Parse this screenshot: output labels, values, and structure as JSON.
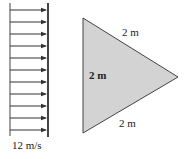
{
  "diagram": {
    "flow": {
      "velocity_label": "12 m/s",
      "arrow_count": 11,
      "arrow_color": "#333333"
    },
    "triangle": {
      "fill": "#d3d3d3",
      "stroke": "#444444",
      "side_top_label": "2 m",
      "side_left_label": "2 m",
      "side_bottom_label": "2 m"
    }
  }
}
